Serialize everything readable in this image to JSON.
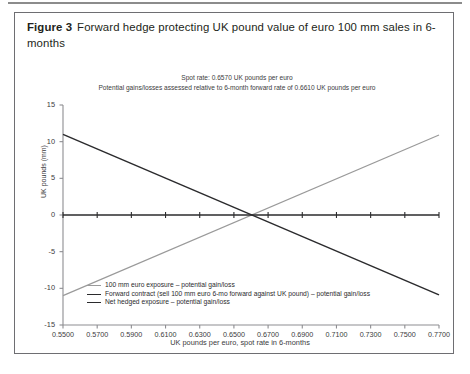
{
  "figure": {
    "number_label": "Figure 3",
    "caption": "Forward hedge protecting UK pound value of euro 100 mm sales in 6-months"
  },
  "annotations": {
    "line1": "Spot rate: 0.6570 UK pounds per euro",
    "line2": "Potential gains/losses assessed relative to 6-month forward rate of 0.6610 UK pounds per euro"
  },
  "colors": {
    "exposure_line": "#9a9a9a",
    "forward_line": "#2b2b2d",
    "net_line": "#2b2b2d",
    "axis": "#8d8d91",
    "border": "#6e6e72",
    "text": "#231f20"
  },
  "chart_data": {
    "type": "line",
    "title": "Forward hedge protecting UK pound value of euro 100 mm sales in 6-months",
    "xlabel": "UK pounds per euro, spot rate in 6-months",
    "ylabel": "UK pounds (mm)",
    "xlim": [
      0.55,
      0.77
    ],
    "ylim": [
      -15,
      15
    ],
    "xticks": [
      "0.5500",
      "0.5700",
      "0.5900",
      "0.6100",
      "0.6300",
      "0.6500",
      "0.6700",
      "0.6900",
      "0.7100",
      "0.7300",
      "0.7500",
      "0.7700"
    ],
    "xtick_values": [
      0.55,
      0.57,
      0.59,
      0.61,
      0.63,
      0.65,
      0.67,
      0.69,
      0.71,
      0.73,
      0.75,
      0.77
    ],
    "yticks": [
      "15",
      "10",
      "5",
      "0",
      "-5",
      "-10",
      "-15"
    ],
    "ytick_values": [
      15,
      10,
      5,
      0,
      -5,
      -10,
      -15
    ],
    "grid": false,
    "legend_position": "inside-bottom-left",
    "spot_rate": 0.657,
    "forward_rate": 0.661,
    "notional_euro_mm": 100,
    "x": [
      0.55,
      0.77
    ],
    "series": [
      {
        "name": "100 mm euro exposure – potential gain/loss",
        "color": "#9a9a9a",
        "width": 1.2,
        "values": [
          -11.0,
          10.9
        ]
      },
      {
        "name": "Forward contract (sell 100 mm euro 6-mo forward against UK pound) – potential gain/loss",
        "color": "#2b2b2d",
        "width": 1.5,
        "values": [
          11.0,
          -10.9
        ]
      },
      {
        "name": "Net hedged exposure – potential gain/loss",
        "color": "#2b2b2d",
        "width": 1.7,
        "values": [
          0,
          0
        ]
      }
    ]
  },
  "legend": {
    "items": [
      {
        "label": "100 mm euro exposure – potential gain/loss",
        "style": "light"
      },
      {
        "label": "Forward contract (sell 100 mm euro 6-mo forward against UK pound) – potential gain/loss",
        "style": "dark"
      },
      {
        "label": "Net hedged exposure – potential gain/loss",
        "style": "dark"
      }
    ]
  }
}
